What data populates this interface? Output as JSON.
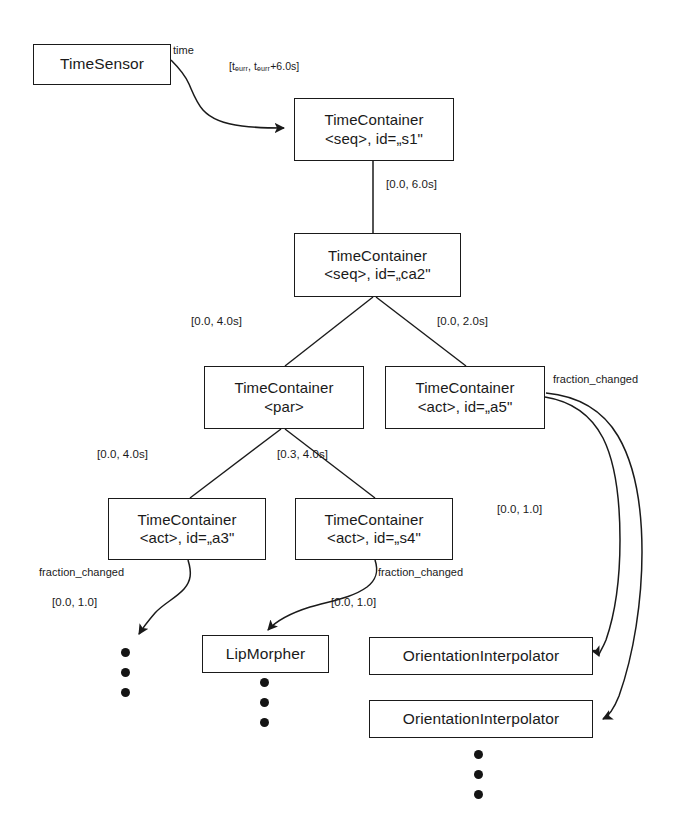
{
  "diagram": {
    "background": "#ffffff",
    "stroke_color": "#1a1a1a",
    "nodes": [
      {
        "id": "timesensor",
        "name": "node-timesensor",
        "line1": "TimeSensor",
        "line2": "",
        "x": 33,
        "y": 44,
        "w": 138,
        "h": 41
      },
      {
        "id": "s1",
        "name": "node-timecontainer-s1",
        "line1": "TimeContainer",
        "line2": "<seq>, id=„s1\"",
        "x": 294,
        "y": 98,
        "w": 160,
        "h": 63
      },
      {
        "id": "ca2",
        "name": "node-timecontainer-ca2",
        "line1": "TimeContainer",
        "line2": "<seq>, id=„ca2\"",
        "x": 294,
        "y": 233,
        "w": 167,
        "h": 64
      },
      {
        "id": "par",
        "name": "node-timecontainer-par",
        "line1": "TimeContainer",
        "line2": "<par>",
        "x": 204,
        "y": 366,
        "w": 160,
        "h": 63
      },
      {
        "id": "a5",
        "name": "node-timecontainer-a5",
        "line1": "TimeContainer",
        "line2": "<act>, id=„a5\"",
        "x": 385,
        "y": 366,
        "w": 160,
        "h": 63
      },
      {
        "id": "a3",
        "name": "node-timecontainer-a3",
        "line1": "TimeContainer",
        "line2": "<act>, id=„a3\"",
        "x": 108,
        "y": 498,
        "w": 158,
        "h": 62
      },
      {
        "id": "s4",
        "name": "node-timecontainer-s4",
        "line1": "TimeContainer",
        "line2": "<act>, id=„s4\"",
        "x": 295,
        "y": 498,
        "w": 158,
        "h": 62
      },
      {
        "id": "lipmorpher",
        "name": "node-lipmorpher",
        "line1": "LipMorpher",
        "line2": "",
        "x": 202,
        "y": 635,
        "w": 127,
        "h": 38
      },
      {
        "id": "orientation1",
        "name": "node-orientationinterpolator-1",
        "line1": "OrientationInterpolator",
        "line2": "",
        "x": 369,
        "y": 637,
        "w": 224,
        "h": 38
      },
      {
        "id": "orientation2",
        "name": "node-orientationinterpolator-2",
        "line1": "OrientationInterpolator",
        "line2": "",
        "x": 369,
        "y": 700,
        "w": 224,
        "h": 38
      }
    ],
    "edge_labels": [
      {
        "id": "time-port",
        "name": "edge-label-time-port",
        "text": "time",
        "x": 173,
        "y": 44,
        "size": "port"
      },
      {
        "id": "tcurr-range",
        "name": "edge-label-tcurr-range",
        "text": "[tₑᵤᵣᵣ, tₑᵤᵣᵣ+6.0s]",
        "x": 229,
        "y": 60,
        "size": "small"
      },
      {
        "id": "range-s1-ca2",
        "name": "edge-label-range-s1-ca2",
        "text": "[0.0, 6.0s]",
        "x": 386,
        "y": 178,
        "size": ""
      },
      {
        "id": "range-ca2-par",
        "name": "edge-label-range-ca2-par",
        "text": "[0.0, 4.0s]",
        "x": 191,
        "y": 315,
        "size": ""
      },
      {
        "id": "range-ca2-a5",
        "name": "edge-label-range-ca2-a5",
        "text": "[0.0, 2.0s]",
        "x": 437,
        "y": 315,
        "size": ""
      },
      {
        "id": "fraction-a5",
        "name": "edge-label-fraction-a5",
        "text": "fraction_changed",
        "x": 553,
        "y": 373,
        "size": "port"
      },
      {
        "id": "range-par-a3",
        "name": "edge-label-range-par-a3",
        "text": "[0.0, 4.0s]",
        "x": 97,
        "y": 448,
        "size": ""
      },
      {
        "id": "range-par-s4",
        "name": "edge-label-range-par-s4",
        "text": "[0.3, 4.0s]",
        "x": 277,
        "y": 448,
        "size": ""
      },
      {
        "id": "range-a5-interp",
        "name": "edge-label-range-a5-interp",
        "text": "[0.0, 1.0]",
        "x": 497,
        "y": 503,
        "size": ""
      },
      {
        "id": "fraction-a3",
        "name": "edge-label-fraction-a3",
        "text": "fraction_changed",
        "x": 39,
        "y": 566,
        "size": "port"
      },
      {
        "id": "fraction-s4",
        "name": "edge-label-fraction-s4",
        "text": "fraction_changed",
        "x": 378,
        "y": 566,
        "size": "port"
      },
      {
        "id": "range-a3-dots",
        "name": "edge-label-range-a3-dots",
        "text": "[0.0, 1.0]",
        "x": 52,
        "y": 596,
        "size": ""
      },
      {
        "id": "range-s4-lip",
        "name": "edge-label-range-s4-lip",
        "text": "[0.0, 1.0]",
        "x": 331,
        "y": 596,
        "size": ""
      }
    ],
    "dot_groups": [
      {
        "id": "dots-a3",
        "name": "ellipsis-dots-a3",
        "x": 121,
        "y": 648,
        "count": 3
      },
      {
        "id": "dots-lip",
        "name": "ellipsis-dots-lipmorpher",
        "x": 260,
        "y": 678,
        "count": 3
      },
      {
        "id": "dots-interp",
        "name": "ellipsis-dots-orientationinterpolator",
        "x": 474,
        "y": 750,
        "count": 3
      }
    ]
  }
}
